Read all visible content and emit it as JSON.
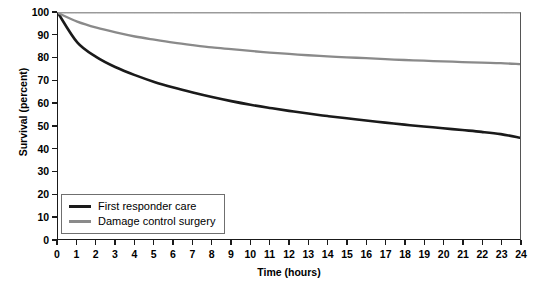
{
  "chart_data": {
    "type": "line",
    "title": "",
    "xlabel": "Time (hours)",
    "ylabel": "Survival (percent)",
    "xlim": [
      0,
      24
    ],
    "ylim": [
      0,
      100
    ],
    "grid": false,
    "legend_position": "lower-left-inside",
    "x_ticks": [
      "0",
      "1",
      "2",
      "3",
      "4",
      "5",
      "6",
      "7",
      "8",
      "9",
      "10",
      "11",
      "12",
      "13",
      "14",
      "15",
      "16",
      "17",
      "18",
      "19",
      "20",
      "21",
      "22",
      "23",
      "24"
    ],
    "y_ticks": [
      "0",
      "10",
      "20",
      "30",
      "40",
      "50",
      "60",
      "70",
      "80",
      "90",
      "100"
    ],
    "x": [
      0,
      1,
      2,
      3,
      4,
      5,
      6,
      7,
      8,
      9,
      10,
      11,
      12,
      13,
      14,
      15,
      16,
      17,
      18,
      19,
      20,
      21,
      22,
      23,
      24
    ],
    "series": [
      {
        "name": "First responder care",
        "color": "#1a1a1a",
        "width": 2.6,
        "values": [
          100,
          87,
          80.5,
          76,
          72.5,
          69.5,
          67,
          64.8,
          62.8,
          61,
          59.4,
          58,
          56.7,
          55.5,
          54.4,
          53.4,
          52.4,
          51.5,
          50.6,
          49.8,
          49,
          48.2,
          47.4,
          46.4,
          44.8
        ]
      },
      {
        "name": "Damage control surgery",
        "color": "#8a8a8a",
        "width": 2.3,
        "values": [
          100,
          96.2,
          93.5,
          91.4,
          89.6,
          88.2,
          86.9,
          85.8,
          84.8,
          84,
          83.2,
          82.5,
          81.9,
          81.3,
          80.8,
          80.4,
          80,
          79.6,
          79.2,
          78.9,
          78.6,
          78.3,
          78,
          77.8,
          77.4
        ]
      },
      {
        "name": "frame-top-line",
        "color": "#9a9a9a",
        "width": 1,
        "values": [
          100,
          100,
          100,
          100,
          100,
          100,
          100,
          100,
          100,
          100,
          100,
          100,
          100,
          100,
          100,
          100,
          100,
          100,
          100,
          100,
          100,
          100,
          100,
          100,
          100
        ]
      }
    ],
    "legend": [
      {
        "label": "First responder care",
        "color": "#1a1a1a"
      },
      {
        "label": "Damage control surgery",
        "color": "#8a8a8a"
      }
    ]
  }
}
